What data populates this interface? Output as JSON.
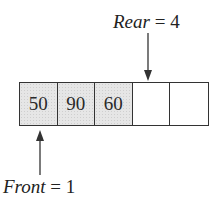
{
  "diagram": {
    "rear": {
      "name": "Rear",
      "equals": " = ",
      "value": "4",
      "points_to_cell_index": 4
    },
    "front": {
      "name": "Front",
      "equals": " = ",
      "value": "1",
      "points_to_cell_index": 1
    },
    "cells": [
      {
        "index": 1,
        "value": "50",
        "filled": true
      },
      {
        "index": 2,
        "value": "90",
        "filled": true
      },
      {
        "index": 3,
        "value": "60",
        "filled": true
      },
      {
        "index": 4,
        "value": "",
        "filled": false
      },
      {
        "index": 5,
        "value": "",
        "filled": false
      }
    ],
    "colors": {
      "stroke": "#333333",
      "filled_cell": "#e6e6e6",
      "empty_cell": "#ffffff",
      "text": "#222222"
    }
  }
}
